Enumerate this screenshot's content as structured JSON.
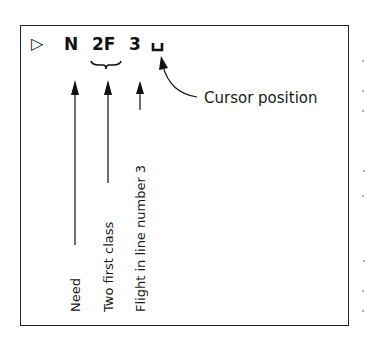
{
  "diagram": {
    "command_line": {
      "prompt_symbol": "▷",
      "tokens": [
        {
          "text": "N",
          "meaning": "Need"
        },
        {
          "text": "2F",
          "meaning": "Two first class"
        },
        {
          "text": "3",
          "meaning": "Flight in line number 3"
        }
      ],
      "cursor_symbol": "⊔"
    },
    "labels": {
      "need": "Need",
      "two_first_class": "Two first class",
      "flight_line": "Flight in line number 3",
      "cursor": "Cursor position"
    },
    "colors": {
      "ink": "#1a1a1a",
      "background": "#ffffff"
    }
  }
}
